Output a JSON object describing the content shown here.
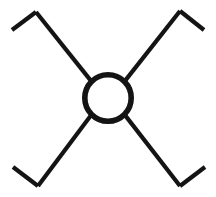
{
  "figure": {
    "canvas": {
      "width": 216,
      "height": 197,
      "background_color": "#FFFFFF"
    },
    "ink_color": "#141414",
    "hub": {
      "name": "center ring",
      "shape": "circle",
      "center_x": 108,
      "center_y": 98,
      "radius": 23.2,
      "stroke_width": 5.6,
      "fill": "none"
    },
    "arm_stroke_width": 4.2,
    "hook_stroke_width": 4.2,
    "arms": [
      {
        "label": "upper-left arm",
        "direction": "northwest",
        "start_x": 91.6,
        "start_y": 81.6,
        "end_x": 36.0,
        "end_y": 12.0,
        "hook": {
          "label": "upper-left hook",
          "type": "peak",
          "vertex_x": 36.0,
          "vertex_y": 12.0,
          "tip_x": 12.0,
          "tip_y": 30.0
        }
      },
      {
        "label": "upper-right arm",
        "direction": "northeast",
        "start_x": 124.4,
        "start_y": 81.6,
        "end_x": 180.0,
        "end_y": 11.0,
        "hook": {
          "label": "upper-right hook",
          "type": "peak",
          "vertex_x": 180.0,
          "vertex_y": 11.0,
          "tip_x": 204.0,
          "tip_y": 30.0
        }
      },
      {
        "label": "lower-left arm",
        "direction": "southwest",
        "start_x": 91.6,
        "start_y": 114.4,
        "end_x": 38.0,
        "end_y": 186.0,
        "hook": {
          "label": "lower-left hook",
          "type": "valley",
          "vertex_x": 38.0,
          "vertex_y": 186.0,
          "tip_x": 13.0,
          "tip_y": 167.0
        }
      },
      {
        "label": "lower-right arm",
        "direction": "southeast",
        "start_x": 124.4,
        "start_y": 114.4,
        "end_x": 180.0,
        "end_y": 186.0,
        "hook": {
          "label": "lower-right hook",
          "type": "valley",
          "vertex_x": 180.0,
          "vertex_y": 186.0,
          "tip_x": 205.0,
          "tip_y": 167.0
        }
      }
    ]
  }
}
